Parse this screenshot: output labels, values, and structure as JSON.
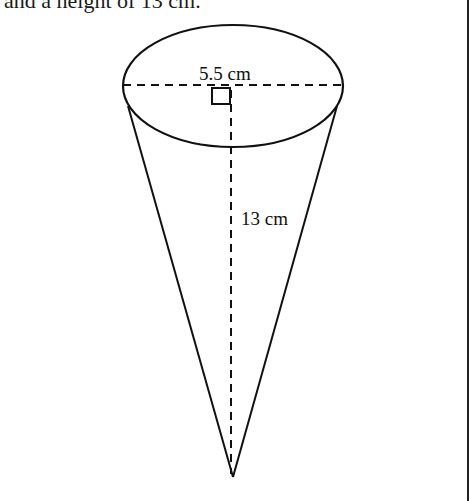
{
  "caption": "and a height of 13 cm.",
  "figure": {
    "shape": "cone",
    "diameter_label": "5.5 cm",
    "height_label": "13 cm",
    "stroke_color": "#111111",
    "background": "#ffffff"
  }
}
